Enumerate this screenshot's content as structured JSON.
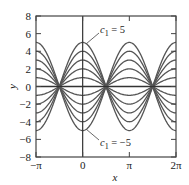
{
  "chart_data": {
    "type": "line",
    "title": "",
    "xlabel": "x",
    "ylabel": "y",
    "xlim": [
      -3.14159,
      6.28319
    ],
    "ylim": [
      -8,
      8
    ],
    "grid": false,
    "legend": "none",
    "function": "y = c1 cos(x)",
    "xticks": [
      {
        "value": -3.14159,
        "label": "−π"
      },
      {
        "value": 0,
        "label": "0"
      },
      {
        "value": 3.14159,
        "label": "π"
      },
      {
        "value": 6.28319,
        "label": "2π"
      }
    ],
    "yticks": [
      {
        "value": 8,
        "label": "8"
      },
      {
        "value": 6,
        "label": "6"
      },
      {
        "value": 4,
        "label": "4"
      },
      {
        "value": 2,
        "label": "2"
      },
      {
        "value": 0,
        "label": "0"
      },
      {
        "value": -2,
        "label": "−2"
      },
      {
        "value": -4,
        "label": "−4"
      },
      {
        "value": -6,
        "label": "−6"
      },
      {
        "value": -8,
        "label": "−8"
      }
    ],
    "series": [
      {
        "name": "c1 = 5",
        "c1": 5
      },
      {
        "name": "c1 = 4",
        "c1": 4
      },
      {
        "name": "c1 = 3",
        "c1": 3
      },
      {
        "name": "c1 = 2",
        "c1": 2
      },
      {
        "name": "c1 = 1",
        "c1": 1
      },
      {
        "name": "c1 = 0",
        "c1": 0
      },
      {
        "name": "c1 = -1",
        "c1": -1
      },
      {
        "name": "c1 = -2",
        "c1": -2
      },
      {
        "name": "c1 = -3",
        "c1": -3
      },
      {
        "name": "c1 = -4",
        "c1": -4
      },
      {
        "name": "c1 = -5",
        "c1": -5
      }
    ],
    "annotations": [
      {
        "text_var": "c",
        "text_sub": "1",
        "text_rest": " = 5",
        "points_to": {
          "x": 0,
          "y": 5
        }
      },
      {
        "text_var": "c",
        "text_sub": "1",
        "text_rest": " = −5",
        "points_to": {
          "x": 0,
          "y": -5
        }
      }
    ],
    "colors": {
      "curve": "#555555",
      "axis": "#333333",
      "frame": "#444444"
    }
  }
}
